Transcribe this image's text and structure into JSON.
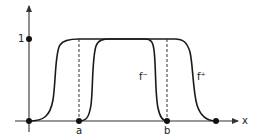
{
  "diagram": {
    "type": "function-plot",
    "axes": {
      "x_label": "x",
      "y_tick_label": "1"
    },
    "points": {
      "a_label": "a",
      "b_label": "b"
    },
    "curves": [
      {
        "name": "f-",
        "label": "f⁻",
        "description": "equals 1 on inner region, 0 outside [a,b]"
      },
      {
        "name": "f+",
        "label": "f⁺",
        "description": "equals 1 on [a,b], 0 outside wider region"
      }
    ],
    "colors": {
      "ink": "#1a1a1a",
      "background": "#ffffff"
    }
  }
}
